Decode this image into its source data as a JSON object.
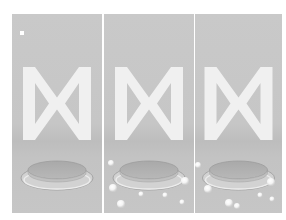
{
  "figure": {
    "panel_count": 3,
    "background": "#ffffff",
    "panel_bg": "#c6c6c6",
    "shape_color": "#f2f2f2",
    "panels": [
      {
        "id": "panel-1",
        "left": 12,
        "width": 90,
        "marker": {
          "x": 8,
          "y": 17,
          "size": 4
        },
        "spheres": []
      },
      {
        "id": "panel-2",
        "left": 104,
        "width": 90,
        "marker": null,
        "spheres": [
          {
            "x": 7,
            "y": 149,
            "r": 3
          },
          {
            "x": 9,
            "y": 174,
            "r": 4
          },
          {
            "x": 17,
            "y": 190,
            "r": 4
          },
          {
            "x": 37,
            "y": 180,
            "r": 2.5
          },
          {
            "x": 61,
            "y": 181,
            "r": 2.5
          },
          {
            "x": 81,
            "y": 167,
            "r": 4
          },
          {
            "x": 78,
            "y": 188,
            "r": 2.5
          }
        ]
      },
      {
        "id": "panel-3",
        "left": 195,
        "width": 87,
        "marker": null,
        "spheres": [
          {
            "x": 3,
            "y": 151,
            "r": 3
          },
          {
            "x": 13,
            "y": 175,
            "r": 4
          },
          {
            "x": 34,
            "y": 189,
            "r": 4
          },
          {
            "x": 42,
            "y": 192,
            "r": 3
          },
          {
            "x": 65,
            "y": 181,
            "r": 2.5
          },
          {
            "x": 76,
            "y": 168,
            "r": 4
          },
          {
            "x": 77,
            "y": 185,
            "r": 2.5
          }
        ]
      }
    ]
  }
}
